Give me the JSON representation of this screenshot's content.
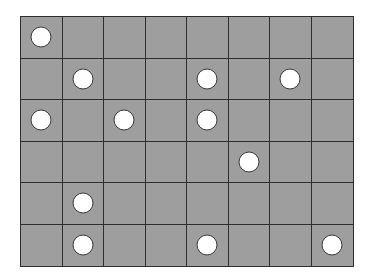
{
  "board": {
    "rows": 6,
    "cols": 8,
    "cell_color": "#9e9e9e",
    "line_color": "#2e2e2e",
    "disc_color": "#ffffff",
    "discs": [
      [
        1,
        0,
        0,
        0,
        0,
        0,
        0,
        0
      ],
      [
        0,
        1,
        0,
        0,
        1,
        0,
        1,
        0
      ],
      [
        1,
        0,
        1,
        0,
        1,
        0,
        0,
        0
      ],
      [
        0,
        0,
        0,
        0,
        0,
        1,
        0,
        0
      ],
      [
        0,
        1,
        0,
        0,
        0,
        0,
        0,
        0
      ],
      [
        0,
        1,
        0,
        0,
        1,
        0,
        0,
        1
      ]
    ]
  }
}
